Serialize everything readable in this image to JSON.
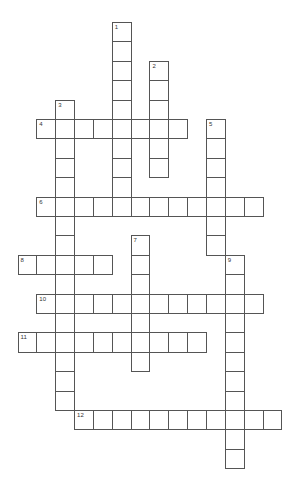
{
  "puzzle": {
    "type": "crossword",
    "grid": {
      "origin_x": 17.5,
      "origin_y": 22,
      "cell_w": 18.85,
      "cell_h": 19.4,
      "border_color": "#555555"
    },
    "words": [
      {
        "number": "1",
        "direction": "down",
        "col": 5,
        "row": 0,
        "length": 10
      },
      {
        "number": "2",
        "direction": "down",
        "col": 7,
        "row": 2,
        "length": 6
      },
      {
        "number": "3",
        "direction": "down",
        "col": 2,
        "row": 4,
        "length": 16
      },
      {
        "number": "4",
        "direction": "across",
        "col": 1,
        "row": 5,
        "length": 8
      },
      {
        "number": "5",
        "direction": "down",
        "col": 10,
        "row": 5,
        "length": 7
      },
      {
        "number": "6",
        "direction": "across",
        "col": 1,
        "row": 9,
        "length": 12
      },
      {
        "number": "7",
        "direction": "down",
        "col": 6,
        "row": 11,
        "length": 7
      },
      {
        "number": "8",
        "direction": "across",
        "col": 0,
        "row": 12,
        "length": 5
      },
      {
        "number": "9",
        "direction": "down",
        "col": 11,
        "row": 12,
        "length": 11
      },
      {
        "number": "10",
        "direction": "across",
        "col": 1,
        "row": 14,
        "length": 12
      },
      {
        "number": "11",
        "direction": "across",
        "col": 0,
        "row": 16,
        "length": 10
      },
      {
        "number": "12",
        "direction": "across",
        "col": 3,
        "row": 20,
        "length": 11
      }
    ]
  }
}
